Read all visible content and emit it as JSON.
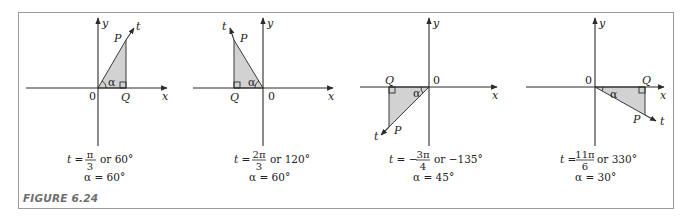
{
  "figure": {
    "label": "FIGURE 6.24",
    "colors": {
      "frame": "#9a9a9a",
      "fill": "#d2d2d2",
      "ink": "#222222",
      "label": "#6e6e6e"
    },
    "panels": [
      {
        "axis_x": "x",
        "axis_y": "y",
        "origin": "0",
        "point_p": "P",
        "point_q": "Q",
        "ray": "t",
        "angle_symbol": "α",
        "t_label": "t =",
        "t_num": "π",
        "t_den": "3",
        "t_or": "or  60°",
        "alpha_eq": "α = 60°"
      },
      {
        "axis_x": "x",
        "axis_y": "y",
        "origin": "0",
        "point_p": "P",
        "point_q": "Q",
        "ray": "t",
        "angle_symbol": "α",
        "t_label": "t =",
        "t_num": "2π",
        "t_den": "3",
        "t_or": "or  120°",
        "alpha_eq": "α = 60°"
      },
      {
        "axis_x": "x",
        "axis_y": "y",
        "origin": "0",
        "point_p": "P",
        "point_q": "Q",
        "ray": "t",
        "angle_symbol": "α",
        "t_label": "t = −",
        "t_num": "3π",
        "t_den": "4",
        "t_or": "or  −135°",
        "alpha_eq": "α = 45°"
      },
      {
        "axis_x": "x",
        "axis_y": "y",
        "origin": "0",
        "point_p": "P",
        "point_q": "Q",
        "ray": "t",
        "angle_symbol": "α",
        "t_label": "t =",
        "t_num": "11π",
        "t_den": "6",
        "t_or": "or  330°",
        "alpha_eq": "α = 30°"
      }
    ]
  }
}
